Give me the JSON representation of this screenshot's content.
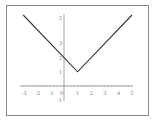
{
  "chart_data": {
    "type": "line",
    "title": "",
    "xlabel": "",
    "ylabel": "",
    "function_note": "Values estimated from pixel geometry; consistent with y = |x - 1| + 1",
    "series": [
      {
        "name": "y",
        "x": [
          -3,
          1,
          5
        ],
        "y": [
          5,
          1,
          5
        ]
      }
    ],
    "x_ticks": [
      "-3",
      "-2",
      "-1",
      "0",
      "1",
      "2",
      "3",
      "4",
      "5"
    ],
    "y_ticks": [
      "-1",
      "1",
      "2",
      "3",
      "5"
    ],
    "xlim": [
      -3,
      5
    ],
    "ylim": [
      -1,
      5
    ],
    "grid": false,
    "legend": null
  }
}
